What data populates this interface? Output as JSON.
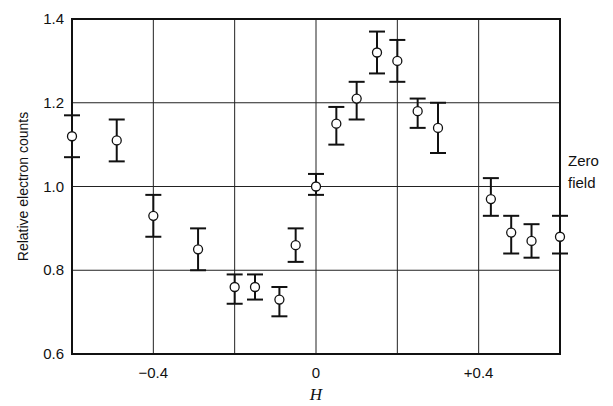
{
  "chart_data": {
    "type": "scatter",
    "title": "",
    "xlabel": "H",
    "ylabel": "Relative electron counts",
    "xlim": [
      -0.6,
      0.6
    ],
    "ylim": [
      0.6,
      1.4
    ],
    "xticks": [
      {
        "v": -0.4,
        "label": "−0.4"
      },
      {
        "v": 0,
        "label": "0"
      },
      {
        "v": 0.4,
        "label": "+0.4"
      }
    ],
    "yticks": [
      {
        "v": 0.6,
        "label": "0.6"
      },
      {
        "v": 0.8,
        "label": "0.8"
      },
      {
        "v": 1.0,
        "label": "1.0"
      },
      {
        "v": 1.2,
        "label": "1.2"
      },
      {
        "v": 1.4,
        "label": "1.4"
      }
    ],
    "grid_x": [
      -0.4,
      -0.2,
      0,
      0.2,
      0.4
    ],
    "grid_y": [
      0.8,
      1.0,
      1.2
    ],
    "annotation": {
      "line1": "Zero",
      "line2": "field"
    },
    "points": [
      {
        "x": -0.6,
        "y": 1.12,
        "lo": 1.07,
        "hi": 1.17
      },
      {
        "x": -0.49,
        "y": 1.11,
        "lo": 1.06,
        "hi": 1.16
      },
      {
        "x": -0.4,
        "y": 0.93,
        "lo": 0.88,
        "hi": 0.98
      },
      {
        "x": -0.29,
        "y": 0.85,
        "lo": 0.8,
        "hi": 0.9
      },
      {
        "x": -0.2,
        "y": 0.76,
        "lo": 0.72,
        "hi": 0.79
      },
      {
        "x": -0.15,
        "y": 0.76,
        "lo": 0.73,
        "hi": 0.79
      },
      {
        "x": -0.09,
        "y": 0.73,
        "lo": 0.69,
        "hi": 0.76
      },
      {
        "x": -0.05,
        "y": 0.86,
        "lo": 0.82,
        "hi": 0.9
      },
      {
        "x": 0.0,
        "y": 1.0,
        "lo": 0.98,
        "hi": 1.03
      },
      {
        "x": 0.05,
        "y": 1.15,
        "lo": 1.1,
        "hi": 1.19
      },
      {
        "x": 0.1,
        "y": 1.21,
        "lo": 1.16,
        "hi": 1.25
      },
      {
        "x": 0.15,
        "y": 1.32,
        "lo": 1.27,
        "hi": 1.37
      },
      {
        "x": 0.2,
        "y": 1.3,
        "lo": 1.25,
        "hi": 1.35
      },
      {
        "x": 0.25,
        "y": 1.18,
        "lo": 1.14,
        "hi": 1.21
      },
      {
        "x": 0.3,
        "y": 1.14,
        "lo": 1.08,
        "hi": 1.2
      },
      {
        "x": 0.43,
        "y": 0.97,
        "lo": 0.93,
        "hi": 1.02
      },
      {
        "x": 0.48,
        "y": 0.89,
        "lo": 0.84,
        "hi": 0.93
      },
      {
        "x": 0.53,
        "y": 0.87,
        "lo": 0.83,
        "hi": 0.91
      },
      {
        "x": 0.6,
        "y": 0.88,
        "lo": 0.84,
        "hi": 0.93
      }
    ]
  }
}
